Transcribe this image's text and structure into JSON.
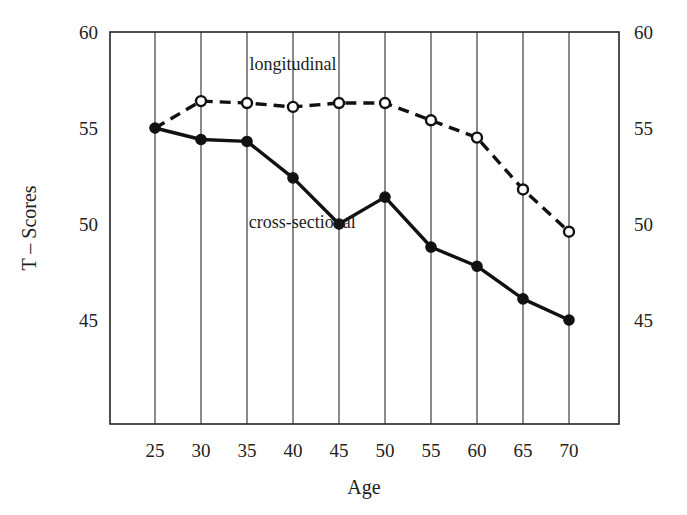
{
  "chart_data": {
    "type": "line",
    "title": "",
    "xlabel": "Age",
    "ylabel": "T – Scores",
    "x": [
      25,
      30,
      35,
      40,
      45,
      50,
      55,
      60,
      65,
      70
    ],
    "xticklabels": [
      "25",
      "30",
      "35",
      "40",
      "45",
      "50",
      "55",
      "60",
      "65",
      "70"
    ],
    "yticks": [
      45,
      50,
      55,
      60
    ],
    "yticklabels": [
      "45",
      "50",
      "55",
      "60"
    ],
    "yticklabels_right": [
      "45",
      "50",
      "55",
      "60"
    ],
    "xlim": [
      22.5,
      72.5
    ],
    "ylim": [
      42.6,
      60.0
    ],
    "grid": "vertical",
    "legend_position": "inline-annotations",
    "series": [
      {
        "name": "longitudinal",
        "style": "dashed",
        "marker": "open-circle",
        "values": [
          55.0,
          56.4,
          56.3,
          56.1,
          56.3,
          56.3,
          55.4,
          54.5,
          51.8,
          49.6
        ],
        "annotation": "longitudinal",
        "annotation_x": 40.0,
        "annotation_y": 58.0
      },
      {
        "name": "cross-sectional",
        "style": "solid",
        "marker": "filled-circle",
        "values": [
          55.0,
          54.4,
          54.3,
          52.4,
          50.0,
          51.4,
          48.8,
          47.8,
          46.1,
          45.0
        ],
        "annotation": "cross-sectional",
        "annotation_x": 41.0,
        "annotation_y": 49.8
      }
    ],
    "colors": {
      "line": "#111111",
      "axis": "#232323",
      "grid": "#2b2b2b",
      "background": "#ffffff",
      "marker_fill_open": "#ffffff"
    }
  }
}
